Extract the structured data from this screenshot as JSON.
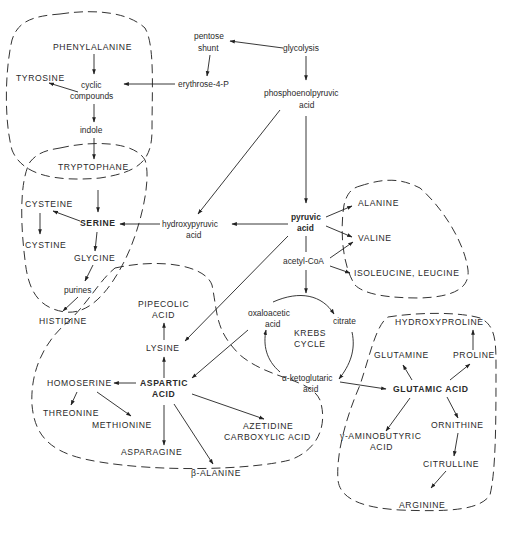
{
  "diagram": {
    "nodes": {
      "glycolysis": "glycolysis",
      "pentose_shunt_1": "pentose",
      "pentose_shunt_2": "shunt",
      "erythrose": "erythrose-4-P",
      "pep_1": "phosphoenolpyruvic",
      "pep_2": "acid",
      "phenylalanine": "PHENYLALANINE",
      "tyrosine": "TYROSINE",
      "cyclic_1": "cyclic",
      "cyclic_2": "compounds",
      "indole": "indole",
      "tryptophane": "TRYPTOPHANE",
      "cysteine": "CYSTEINE",
      "cystine": "CYSTINE",
      "serine": "SERINE",
      "glycine": "GLYCINE",
      "purines": "purines",
      "histidine": "HISTIDINE",
      "hydroxypyruvic_1": "hydroxypyruvic",
      "hydroxypyruvic_2": "acid",
      "pyruvic_1": "pyruvic",
      "pyruvic_2": "acid",
      "alanine": "ALANINE",
      "valine": "VALINE",
      "acetyl_coa": "acetyl-CoA",
      "isoleucine_leucine": "ISOLEUCINE, LEUCINE",
      "oxaloacetic_1": "oxaloacetic",
      "oxaloacetic_2": "acid",
      "citrate": "citrate",
      "krebs_1": "KREBS",
      "krebs_2": "CYCLE",
      "ketoglutaric_1": "α-ketoglutaric",
      "ketoglutaric_2": "acid",
      "pipecolic_1": "PIPECOLIC",
      "pipecolic_2": "ACID",
      "lysine": "LYSINE",
      "aspartic_1": "ASPARTIC",
      "aspartic_2": "ACID",
      "homoserine": "HOMOSERINE",
      "threonine": "THREONINE",
      "methionine": "METHIONINE",
      "asparagine": "ASPARAGINE",
      "beta_alanine": "β-ALANINE",
      "azetidine_1": "AZETIDINE",
      "azetidine_2": "CARBOXYLIC ACID",
      "hydroxyproline": "HYDROXYPROLINE",
      "glutamine": "GLUTAMINE",
      "proline": "PROLINE",
      "glutamic": "GLUTAMIC ACID",
      "ornithine": "ORNITHINE",
      "gaba_1": "γ-AMINOBUTYRIC",
      "gaba_2": "ACID",
      "citrulline": "CITRULLINE",
      "arginine": "ARGININE"
    },
    "groups": [
      "aromatic-family",
      "serine-family",
      "pyruvate-family",
      "aspartate-family",
      "glutamate-family"
    ],
    "colors": {
      "ink": "#222222",
      "background": "#ffffff"
    }
  }
}
